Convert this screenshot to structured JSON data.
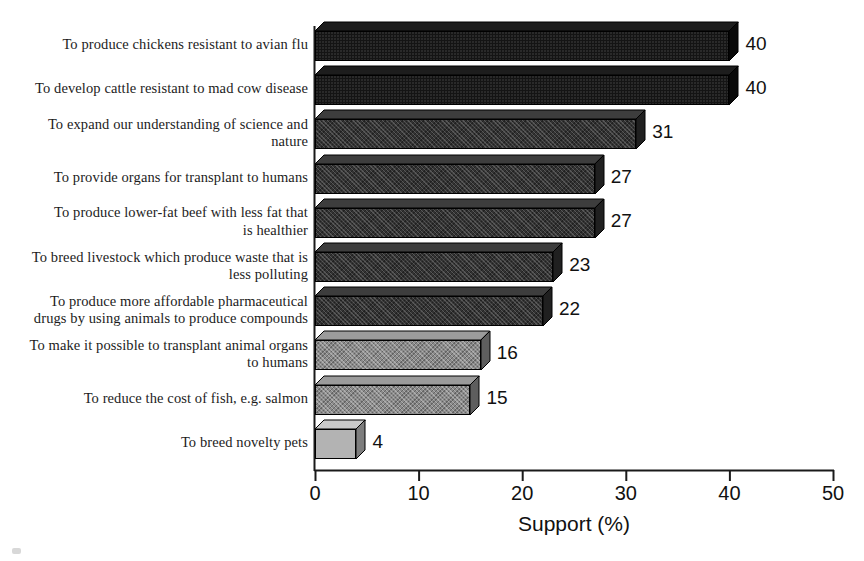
{
  "chart_data": {
    "type": "bar",
    "orientation": "horizontal",
    "title": "",
    "subtitle": "",
    "xlabel": "Support (%)",
    "ylabel": "",
    "xlim": [
      0,
      50
    ],
    "xticks": [
      0,
      10,
      20,
      30,
      40,
      50
    ],
    "xtick_labels": [
      "0",
      "10",
      "20",
      "30",
      "40",
      "50"
    ],
    "grid": false,
    "legend": null,
    "categories": [
      "To produce chickens resistant to avian flu",
      "To develop cattle resistant to mad cow disease",
      "To expand our understanding of science and nature",
      "To provide organs for transplant to humans",
      "To produce lower-fat beef with less fat that is healthier",
      "To breed livestock which produce waste that is less polluting",
      "To produce more affordable pharmaceutical drugs by using animals to produce compounds",
      "To make it possible to transplant animal organs to humans",
      "To reduce the cost of fish, e.g. salmon",
      "To breed novelty pets"
    ],
    "category_lines": [
      [
        "To produce chickens resistant to avian flu"
      ],
      [
        "To develop cattle resistant to mad cow disease"
      ],
      [
        "To expand our understanding of science and",
        "nature"
      ],
      [
        "To provide organs for transplant to humans"
      ],
      [
        "To produce lower-fat beef with less fat that",
        "is healthier"
      ],
      [
        "To breed livestock which produce waste that is",
        "less polluting"
      ],
      [
        "To produce more affordable pharmaceutical",
        "drugs by using animals to produce compounds"
      ],
      [
        "To make it possible to transplant animal organs",
        "to humans"
      ],
      [
        "To reduce the cost of fish, e.g. salmon"
      ],
      [
        "To breed novelty pets"
      ]
    ],
    "values": [
      40,
      40,
      31,
      27,
      27,
      23,
      22,
      16,
      15,
      4
    ],
    "value_labels": [
      "40",
      "40",
      "31",
      "27",
      "27",
      "23",
      "22",
      "16",
      "15",
      "4"
    ],
    "bar_shades": [
      "black",
      "black",
      "darkgray",
      "darkgray",
      "darkgray",
      "darkgray",
      "darkgray",
      "midgray",
      "midgray",
      "lightgray"
    ]
  },
  "colors": {
    "black": "#141414",
    "darkgray": "#333333",
    "midgray": "#8a8a8a",
    "lightgray": "#b3b3b3",
    "axis": "#1a1a1a",
    "text": "#111111",
    "background": "#ffffff"
  }
}
